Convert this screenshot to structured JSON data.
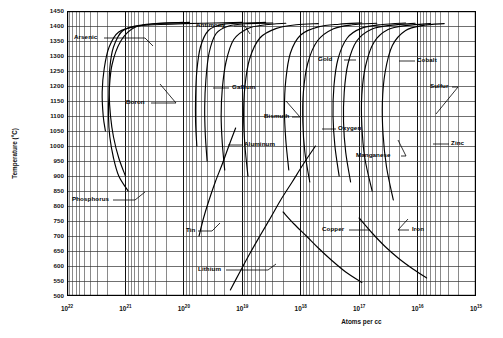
{
  "chart_data": {
    "type": "line",
    "title": "",
    "xlabel": "Atoms per cc",
    "ylabel": "Temperature (°C)",
    "xscale": "log",
    "x_reversed": true,
    "xlim": [
      1e+22,
      1000000000000000.0
    ],
    "ylim": [
      500,
      1450
    ],
    "grid": true,
    "x_ticks": [
      {
        "label_base": "10",
        "label_exp": "22",
        "value": 1e+22
      },
      {
        "label_base": "10",
        "label_exp": "21",
        "value": 1e+21
      },
      {
        "label_base": "10",
        "label_exp": "20",
        "value": 1e+20
      },
      {
        "label_base": "10",
        "label_exp": "19",
        "value": 1e+19
      },
      {
        "label_base": "10",
        "label_exp": "18",
        "value": 1e+18
      },
      {
        "label_base": "10",
        "label_exp": "17",
        "value": 1e+17
      },
      {
        "label_base": "10",
        "label_exp": "16",
        "value": 1e+16
      },
      {
        "label_base": "10",
        "label_exp": "15",
        "value": 1000000000000000.0
      }
    ],
    "y_ticks": [
      1450,
      1400,
      1350,
      1300,
      1250,
      1200,
      1150,
      1100,
      1050,
      1000,
      950,
      900,
      850,
      800,
      750,
      700,
      650,
      600,
      550,
      500
    ],
    "legend_position": "inline-callouts",
    "annotations": [
      {
        "name": "arsenic",
        "label": "Arsenic"
      },
      {
        "name": "antimony",
        "label": "Antimony"
      },
      {
        "name": "boron",
        "label": "Boron"
      },
      {
        "name": "gallium",
        "label": "Gallium"
      },
      {
        "name": "bismuth",
        "label": "Bismuth"
      },
      {
        "name": "aluminum",
        "label": "Aluminum"
      },
      {
        "name": "gold",
        "label": "Gold"
      },
      {
        "name": "oxygen",
        "label": "Oxygen"
      },
      {
        "name": "cobalt",
        "label": "Cobalt"
      },
      {
        "name": "sulfur",
        "label": "Sulfur"
      },
      {
        "name": "zinc",
        "label": "Zinc"
      },
      {
        "name": "manganese",
        "label": "Manganese"
      },
      {
        "name": "phosphorus",
        "label": "Phosphorus"
      },
      {
        "name": "tin",
        "label": "Tin"
      },
      {
        "name": "copper",
        "label": "Copper"
      },
      {
        "name": "iron",
        "label": "Iron"
      },
      {
        "name": "lithium",
        "label": "Lithium"
      }
    ],
    "series": [
      {
        "name": "Arsenic",
        "points": [
          [
            2.2e+21,
            1050
          ],
          [
            2.4e+21,
            1100
          ],
          [
            2.5e+21,
            1180
          ],
          [
            2.3e+21,
            1260
          ],
          [
            1.9e+21,
            1330
          ],
          [
            1.3e+21,
            1380
          ],
          [
            6e+20,
            1400
          ],
          [
            2.5e+20,
            1405
          ],
          [
            1e+20,
            1408
          ],
          [
            3e+19,
            1410
          ],
          [
            1e+19,
            1412
          ]
        ]
      },
      {
        "name": "Boron",
        "points": [
          [
            1e+21,
            900
          ],
          [
            1.3e+21,
            960
          ],
          [
            1.6e+21,
            1030
          ],
          [
            1.8e+21,
            1100
          ],
          [
            1.9e+21,
            1180
          ],
          [
            1.85e+21,
            1260
          ],
          [
            1.6e+21,
            1330
          ],
          [
            1.1e+21,
            1385
          ],
          [
            5e+20,
            1404
          ],
          [
            2e+20,
            1410
          ],
          [
            8e+19,
            1412
          ]
        ]
      },
      {
        "name": "Phosphorus",
        "points": [
          [
            9e+20,
            850
          ],
          [
            1.3e+21,
            900
          ],
          [
            1.6e+21,
            960
          ],
          [
            1.85e+21,
            1030
          ],
          [
            1.95e+21,
            1100
          ],
          [
            1.9e+21,
            1180
          ],
          [
            1.7e+21,
            1270
          ],
          [
            1.2e+21,
            1350
          ],
          [
            7e+20,
            1395
          ],
          [
            3e+20,
            1408
          ],
          [
            1e+20,
            1412
          ]
        ]
      },
      {
        "name": "Antimony",
        "points": [
          [
            6e+19,
            1000
          ],
          [
            6.3e+19,
            1080
          ],
          [
            6.3e+19,
            1160
          ],
          [
            6e+19,
            1250
          ],
          [
            5.2e+19,
            1330
          ],
          [
            3.8e+19,
            1385
          ],
          [
            2.2e+19,
            1405
          ],
          [
            1e+19,
            1410
          ],
          [
            4e+18,
            1412
          ]
        ]
      },
      {
        "name": "Gallium",
        "points": [
          [
            4e+19,
            950
          ],
          [
            4.3e+19,
            1040
          ],
          [
            4.4e+19,
            1130
          ],
          [
            4.2e+19,
            1220
          ],
          [
            3.7e+19,
            1310
          ],
          [
            2.8e+19,
            1375
          ],
          [
            1.7e+19,
            1400
          ],
          [
            8e+18,
            1408
          ],
          [
            3e+18,
            1410
          ]
        ]
      },
      {
        "name": "Aluminum",
        "points": [
          [
            2e+19,
            920
          ],
          [
            2.2e+19,
            1010
          ],
          [
            2.3e+19,
            1100
          ],
          [
            2.2e+19,
            1190
          ],
          [
            1.9e+19,
            1280
          ],
          [
            1.4e+19,
            1355
          ],
          [
            8e+18,
            1392
          ],
          [
            4e+18,
            1404
          ],
          [
            1.8e+18,
            1409
          ]
        ]
      },
      {
        "name": "Bismuth",
        "points": [
          [
            8e+18,
            900
          ],
          [
            9e+18,
            1000
          ],
          [
            9.5e+18,
            1100
          ],
          [
            9e+18,
            1200
          ],
          [
            7.5e+18,
            1290
          ],
          [
            5e+18,
            1360
          ],
          [
            2.6e+18,
            1392
          ],
          [
            1.2e+18,
            1404
          ],
          [
            5e+17,
            1408
          ]
        ]
      },
      {
        "name": "Gold",
        "points": [
          [
            1.6e+18,
            920
          ],
          [
            1.8e+18,
            1020
          ],
          [
            1.9e+18,
            1120
          ],
          [
            1.8e+18,
            1220
          ],
          [
            1.5e+18,
            1310
          ],
          [
            1e+18,
            1370
          ],
          [
            5e+17,
            1397
          ],
          [
            2.2e+17,
            1406
          ],
          [
            9e+16,
            1410
          ]
        ]
      },
      {
        "name": "Oxygen",
        "points": [
          [
            7e+17,
            880
          ],
          [
            8.5e+17,
            980
          ],
          [
            9.2e+17,
            1080
          ],
          [
            9e+17,
            1180
          ],
          [
            7.6e+17,
            1275
          ],
          [
            5.2e+17,
            1350
          ],
          [
            2.8e+17,
            1390
          ],
          [
            1.3e+17,
            1404
          ],
          [
            5e+16,
            1409
          ]
        ]
      },
      {
        "name": "Cobalt",
        "points": [
          [
            2.2e+17,
            900
          ],
          [
            2.6e+17,
            1000
          ],
          [
            2.8e+17,
            1100
          ],
          [
            2.7e+17,
            1200
          ],
          [
            2.3e+17,
            1290
          ],
          [
            1.6e+17,
            1360
          ],
          [
            9e+16,
            1393
          ],
          [
            4e+16,
            1405
          ],
          [
            1.6e+16,
            1410
          ]
        ]
      },
      {
        "name": "Manganese",
        "points": [
          [
            1.4e+17,
            880
          ],
          [
            1.7e+17,
            980
          ],
          [
            1.85e+17,
            1080
          ],
          [
            1.8e+17,
            1180
          ],
          [
            1.55e+17,
            1275
          ],
          [
            1.1e+17,
            1350
          ],
          [
            6e+16,
            1390
          ],
          [
            2.7e+16,
            1403
          ],
          [
            1.1e+16,
            1409
          ]
        ]
      },
      {
        "name": "Sulfur",
        "points": [
          [
            6e+16,
            850
          ],
          [
            8e+16,
            960
          ],
          [
            9e+16,
            1070
          ],
          [
            9e+16,
            1170
          ],
          [
            7.8e+16,
            1265
          ],
          [
            5.6e+16,
            1345
          ],
          [
            3.2e+16,
            1388
          ],
          [
            1.5e+16,
            1402
          ],
          [
            6000000000000000.0,
            1408
          ]
        ]
      },
      {
        "name": "Zinc",
        "points": [
          [
            2.6e+16,
            820
          ],
          [
            3.4e+16,
            930
          ],
          [
            3.9e+16,
            1040
          ],
          [
            4e+16,
            1145
          ],
          [
            3.6e+16,
            1245
          ],
          [
            2.7e+16,
            1335
          ],
          [
            1.6e+16,
            1385
          ],
          [
            8000000000000000.0,
            1402
          ],
          [
            3500000000000000.0,
            1408
          ]
        ]
      },
      {
        "name": "Tin",
        "points": [
          [
            5.5e+19,
            700
          ],
          [
            4.6e+19,
            760
          ],
          [
            3.7e+19,
            820
          ],
          [
            2.9e+19,
            880
          ],
          [
            2.2e+19,
            940
          ],
          [
            1.7e+19,
            1000
          ],
          [
            1.3e+19,
            1060
          ]
        ]
      },
      {
        "name": "Lithium",
        "points": [
          [
            1.6e+19,
            520
          ],
          [
            1.1e+19,
            580
          ],
          [
            7.5e+18,
            640
          ],
          [
            5e+18,
            700
          ],
          [
            3.3e+18,
            760
          ],
          [
            2.2e+18,
            820
          ],
          [
            1.4e+18,
            880
          ],
          [
            9e+17,
            940
          ],
          [
            5.6e+17,
            1000
          ]
        ]
      },
      {
        "name": "Copper",
        "points": [
          [
            2e+18,
            780
          ],
          [
            1.3e+18,
            740
          ],
          [
            8e+17,
            700
          ],
          [
            5e+17,
            660
          ],
          [
            3e+17,
            620
          ],
          [
            1.7e+17,
            580
          ],
          [
            9e+16,
            545
          ]
        ]
      },
      {
        "name": "Iron",
        "points": [
          [
            1e+17,
            760
          ],
          [
            6e+16,
            710
          ],
          [
            3.6e+16,
            665
          ],
          [
            2.1e+16,
            625
          ],
          [
            1.2e+16,
            590
          ],
          [
            7000000000000000.0,
            560
          ]
        ]
      }
    ]
  },
  "axes": {
    "y_title": "Temperature (°C)",
    "x_title": "Atoms per cc"
  }
}
